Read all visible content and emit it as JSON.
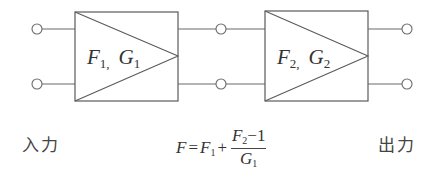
{
  "diagram": {
    "type": "cascaded two-port amplifier block diagram",
    "blocks": [
      {
        "id": "stage1",
        "noise_figure": {
          "symbol": "F",
          "subscript": "1"
        },
        "gain": {
          "symbol": "G",
          "subscript": "1"
        },
        "separator": ","
      },
      {
        "id": "stage2",
        "noise_figure": {
          "symbol": "F",
          "subscript": "2"
        },
        "gain": {
          "symbol": "G",
          "subscript": "2"
        },
        "separator": ","
      }
    ],
    "input_label": "入力",
    "output_label": "出力",
    "formula": {
      "lhs": "F",
      "equals": "=",
      "term1": {
        "symbol": "F",
        "subscript": "1"
      },
      "plus": "+",
      "numerator": {
        "symbol": "F",
        "subscript": "2",
        "minus": "−",
        "constant": "1"
      },
      "denominator": {
        "symbol": "G",
        "subscript": "1"
      }
    },
    "colors": {
      "line": "#5a5a5a",
      "text": "#333333",
      "background": "#ffffff"
    }
  }
}
